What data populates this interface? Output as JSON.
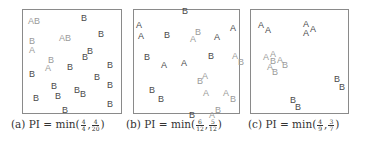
{
  "figure": {
    "panels": [
      {
        "id": "a",
        "box": {
          "left": 22,
          "top": 9,
          "width": 100,
          "height": 105
        },
        "caption": {
          "prefix": "(a) PI = min(",
          "f1_num": "4",
          "f1_den": "4",
          "sep": ",",
          "f2_num": "4",
          "f2_den": "20",
          "suffix": ")",
          "left": 11
        },
        "points": [
          {
            "t": "AB",
            "x": 5,
            "y": 7,
            "light": true
          },
          {
            "t": "B",
            "x": 58,
            "y": 4,
            "light": false
          },
          {
            "t": "B",
            "x": 75,
            "y": 20,
            "light": false
          },
          {
            "t": "AB",
            "x": 36,
            "y": 24,
            "light": true
          },
          {
            "t": "B",
            "x": 6,
            "y": 27,
            "light": true
          },
          {
            "t": "A",
            "x": 6,
            "y": 36,
            "light": true
          },
          {
            "t": "B",
            "x": 64,
            "y": 37,
            "light": false
          },
          {
            "t": "B",
            "x": 59,
            "y": 43,
            "light": false
          },
          {
            "t": "B",
            "x": 25,
            "y": 46,
            "light": true
          },
          {
            "t": "A",
            "x": 22,
            "y": 54,
            "light": true
          },
          {
            "t": "B",
            "x": 44,
            "y": 53,
            "light": false
          },
          {
            "t": "B",
            "x": 84,
            "y": 51,
            "light": false
          },
          {
            "t": "B",
            "x": 6,
            "y": 60,
            "light": false
          },
          {
            "t": "B",
            "x": 71,
            "y": 63,
            "light": false
          },
          {
            "t": "B",
            "x": 28,
            "y": 72,
            "light": false
          },
          {
            "t": "B",
            "x": 84,
            "y": 71,
            "light": false
          },
          {
            "t": "B",
            "x": 51,
            "y": 76,
            "light": false
          },
          {
            "t": "B",
            "x": 57,
            "y": 80,
            "light": false
          },
          {
            "t": "B",
            "x": 10,
            "y": 84,
            "light": false
          },
          {
            "t": "B",
            "x": 32,
            "y": 82,
            "light": false
          },
          {
            "t": "B",
            "x": 84,
            "y": 90,
            "light": false
          },
          {
            "t": "B",
            "x": 39,
            "y": 96,
            "light": false
          }
        ]
      },
      {
        "id": "b",
        "box": {
          "left": 133,
          "top": 9,
          "width": 107,
          "height": 105
        },
        "caption": {
          "prefix": "(b) PI = min(",
          "f1_num": "6",
          "f1_den": "12",
          "sep": ",",
          "f2_num": "5",
          "f2_den": "12",
          "suffix": ")",
          "left": 126
        },
        "points": [
          {
            "t": "B",
            "x": 48,
            "y": -3,
            "light": false
          },
          {
            "t": "A",
            "x": 2,
            "y": 11,
            "light": false
          },
          {
            "t": "A",
            "x": 96,
            "y": 14,
            "light": false
          },
          {
            "t": "A",
            "x": 4,
            "y": 22,
            "light": false
          },
          {
            "t": "B",
            "x": 30,
            "y": 21,
            "light": false
          },
          {
            "t": "B",
            "x": 61,
            "y": 18,
            "light": true
          },
          {
            "t": "A",
            "x": 56,
            "y": 25,
            "light": true
          },
          {
            "t": "A",
            "x": 80,
            "y": 23,
            "light": false
          },
          {
            "t": "B",
            "x": 10,
            "y": 43,
            "light": false
          },
          {
            "t": "B",
            "x": 74,
            "y": 42,
            "light": false
          },
          {
            "t": "A",
            "x": 98,
            "y": 42,
            "light": true
          },
          {
            "t": "B",
            "x": 104,
            "y": 48,
            "light": true
          },
          {
            "t": "A",
            "x": 27,
            "y": 51,
            "light": false
          },
          {
            "t": "A",
            "x": 47,
            "y": 49,
            "light": false
          },
          {
            "t": "A",
            "x": 68,
            "y": 62,
            "light": true
          },
          {
            "t": "B",
            "x": 63,
            "y": 67,
            "light": true
          },
          {
            "t": "B",
            "x": 15,
            "y": 76,
            "light": false
          },
          {
            "t": "A",
            "x": 69,
            "y": 79,
            "light": true
          },
          {
            "t": "A",
            "x": 89,
            "y": 79,
            "light": true
          },
          {
            "t": "B",
            "x": 96,
            "y": 85,
            "light": true
          },
          {
            "t": "B",
            "x": 24,
            "y": 85,
            "light": false
          },
          {
            "t": "B",
            "x": 81,
            "y": 96,
            "light": true
          },
          {
            "t": "A",
            "x": 75,
            "y": 101,
            "light": true
          },
          {
            "t": "B",
            "x": 55,
            "y": 101,
            "light": false
          }
        ]
      },
      {
        "id": "c",
        "box": {
          "left": 250,
          "top": 9,
          "width": 99,
          "height": 105
        },
        "caption": {
          "prefix": "(c) PI = min(",
          "f1_num": "4",
          "f1_den": "9",
          "sep": ",",
          "f2_num": "3",
          "f2_den": "7",
          "suffix": ")",
          "left": 248
        },
        "points": [
          {
            "t": "A",
            "x": 7,
            "y": 11,
            "light": false
          },
          {
            "t": "A",
            "x": 14,
            "y": 16,
            "light": false
          },
          {
            "t": "A",
            "x": 52,
            "y": 10,
            "light": false
          },
          {
            "t": "A",
            "x": 59,
            "y": 15,
            "light": false
          },
          {
            "t": "A",
            "x": 52,
            "y": 19,
            "light": false
          },
          {
            "t": "A",
            "x": 12,
            "y": 43,
            "light": true
          },
          {
            "t": "A",
            "x": 19,
            "y": 40,
            "light": true
          },
          {
            "t": "B",
            "x": 19,
            "y": 47,
            "light": true
          },
          {
            "t": "A",
            "x": 26,
            "y": 46,
            "light": true
          },
          {
            "t": "B",
            "x": 31,
            "y": 51,
            "light": true
          },
          {
            "t": "A",
            "x": 16,
            "y": 53,
            "light": true
          },
          {
            "t": "B",
            "x": 21,
            "y": 58,
            "light": true
          },
          {
            "t": "B",
            "x": 83,
            "y": 65,
            "light": false
          },
          {
            "t": "B",
            "x": 88,
            "y": 73,
            "light": false
          },
          {
            "t": "B",
            "x": 39,
            "y": 86,
            "light": false
          },
          {
            "t": "B",
            "x": 44,
            "y": 93,
            "light": false
          }
        ]
      }
    ]
  }
}
